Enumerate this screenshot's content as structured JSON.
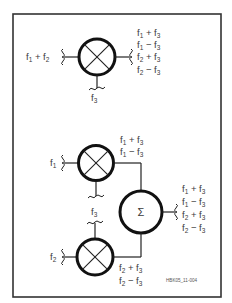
{
  "figure": {
    "id_label": "HBK05_11-004",
    "frame_color": "#333333",
    "line_color": "#222222"
  },
  "top_mixer": {
    "input_left": {
      "base1": "f",
      "sub1": "1",
      "op": " + ",
      "base2": "f",
      "sub2": "2"
    },
    "input_bottom": {
      "base": "f",
      "sub": "3"
    },
    "outputs": [
      {
        "base1": "f",
        "sub1": "1",
        "op": " + ",
        "base2": "f",
        "sub2": "3"
      },
      {
        "base1": "f",
        "sub1": "1",
        "op": " − ",
        "base2": "f",
        "sub2": "3"
      },
      {
        "base1": "f",
        "sub1": "2",
        "op": " + ",
        "base2": "f",
        "sub2": "3"
      },
      {
        "base1": "f",
        "sub1": "2",
        "op": " − ",
        "base2": "f",
        "sub2": "3"
      }
    ]
  },
  "mixer_f1": {
    "input_left": {
      "base": "f",
      "sub": "1"
    },
    "outputs": [
      {
        "base1": "f",
        "sub1": "1",
        "op": " + ",
        "base2": "f",
        "sub2": "3"
      },
      {
        "base1": "f",
        "sub1": "1",
        "op": " − ",
        "base2": "f",
        "sub2": "3"
      }
    ]
  },
  "mixer_f2": {
    "input_left": {
      "base": "f",
      "sub": "2"
    },
    "input_top": {
      "base": "f",
      "sub": "3"
    },
    "outputs": [
      {
        "base1": "f",
        "sub1": "2",
        "op": " + ",
        "base2": "f",
        "sub2": "3"
      },
      {
        "base1": "f",
        "sub1": "2",
        "op": " − ",
        "base2": "f",
        "sub2": "3"
      }
    ]
  },
  "summer": {
    "symbol": "Σ",
    "outputs": [
      {
        "base1": "f",
        "sub1": "1",
        "op": " + ",
        "base2": "f",
        "sub2": "3"
      },
      {
        "base1": "f",
        "sub1": "1",
        "op": " − ",
        "base2": "f",
        "sub2": "3"
      },
      {
        "base1": "f",
        "sub1": "2",
        "op": " + ",
        "base2": "f",
        "sub2": "3"
      },
      {
        "base1": "f",
        "sub1": "2",
        "op": " − ",
        "base2": "f",
        "sub2": "3"
      }
    ]
  }
}
